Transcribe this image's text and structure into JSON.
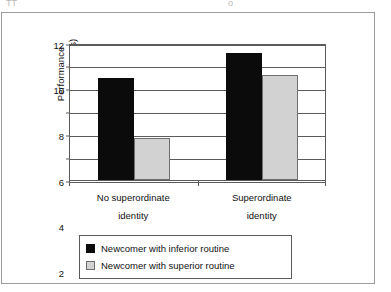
{
  "page_fragment": {
    "left": "TT",
    "right": "o"
  },
  "chart_data": {
    "type": "bar",
    "title": "",
    "subtitle": "",
    "xlabel": "",
    "ylabel_line1": "Performance",
    "ylabel_line2": "(no. of sailboats)",
    "categories": [
      {
        "line1": "No superordinate",
        "line2": "identity"
      },
      {
        "line1": "Superordinate",
        "line2": "identity"
      }
    ],
    "category_labels": [
      "No superordinate identity",
      "Superordinate identity"
    ],
    "series": [
      {
        "name": "Newcomer with inferior routine",
        "color": "#0b0b0b",
        "values": [
          8.9,
          11.1
        ]
      },
      {
        "name": "Newcomer with superior routine",
        "color": "#d2d2d2",
        "values": [
          3.7,
          9.2
        ]
      }
    ],
    "ylim": [
      0,
      12
    ],
    "ytick_values": [
      0,
      2,
      4,
      6,
      8,
      10,
      12
    ],
    "ytick_labels": [
      "0",
      "2",
      "4",
      "6",
      "8",
      "10",
      "12"
    ],
    "grid": "horizontal",
    "legend_position": "bottom-center",
    "axis_color": "#5b5b5b"
  }
}
